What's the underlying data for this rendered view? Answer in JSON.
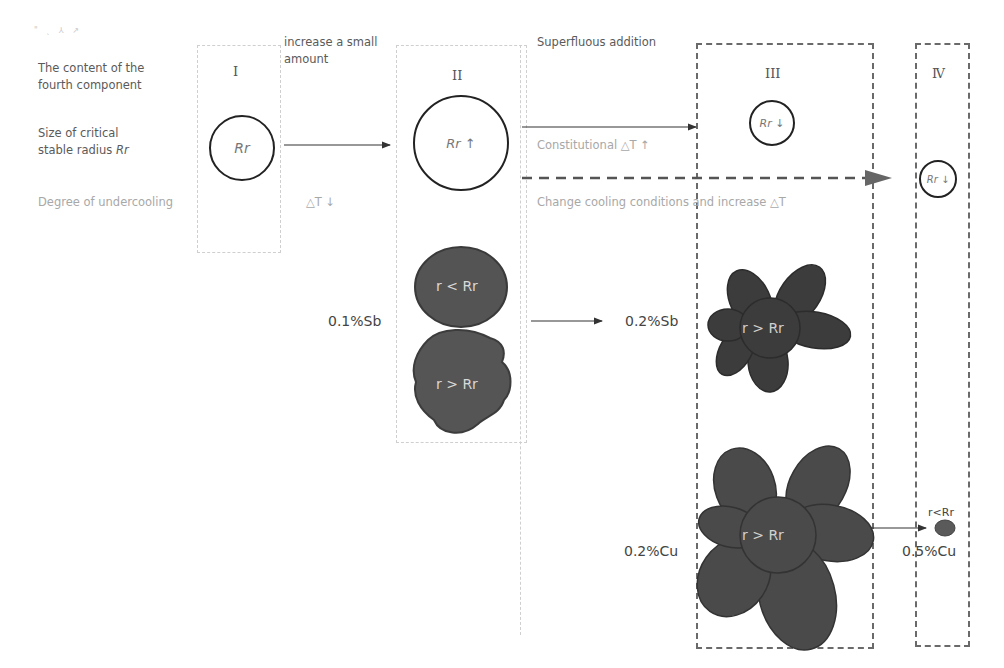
{
  "row_labels": {
    "content_line1": "The content of the",
    "content_line2": "fourth component",
    "radius_line1": "Size of critical",
    "radius_line2_prefix": "stable radius ",
    "radius_line2_symbol": "Rr",
    "undercooling": "Degree of undercooling"
  },
  "stray_marks": "\" ˎ ⅄ ↗",
  "stages": {
    "I": {
      "numeral": "I",
      "circle_label": "Rr"
    },
    "II": {
      "numeral": "II",
      "circle_label": "Rr ↑"
    },
    "III": {
      "numeral": "III",
      "circle_label": "Rr ↓"
    },
    "IV": {
      "numeral": "Ⅳ",
      "circle_label": "Rr ↓"
    }
  },
  "transitions": {
    "I_to_II": {
      "label_line1": "increase a small",
      "label_line2": "amount",
      "undercooling": "△T ↓"
    },
    "II_to_III": {
      "label": "Superfluous addition",
      "undercooling": "Constitutional △T ↑"
    },
    "II_to_IV": {
      "label": "Change cooling conditions and increase △T"
    }
  },
  "grains": {
    "sb01_round": "r < Rr",
    "sb01_irregular": "r > Rr",
    "sb02_flower": "r > Rr",
    "cu02_flower": "r > Rr",
    "cu05_small": "r<Rr"
  },
  "compositions": {
    "sb01": "0.1%Sb",
    "sb02": "0.2%Sb",
    "cu02": "0.2%Cu",
    "cu05": "0.5%Cu"
  },
  "colors": {
    "grain_fill": "#505050",
    "grain_edge": "#3a3a3a",
    "circle_stroke": "#222222",
    "light_text": "#a8a8a8",
    "dark_text": "#444444"
  }
}
